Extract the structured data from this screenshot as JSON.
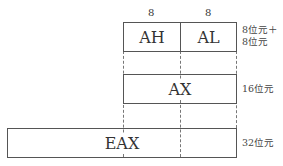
{
  "diagram": {
    "top_labels": [
      "8",
      "8"
    ],
    "registers": {
      "ah": "AH",
      "al": "AL",
      "ax": "AX",
      "eax": "EAX"
    },
    "sizes": {
      "ah_al_line1": "8位元＋",
      "ah_al_line2": "8位元",
      "ax": "16位元",
      "eax": "32位元"
    }
  }
}
